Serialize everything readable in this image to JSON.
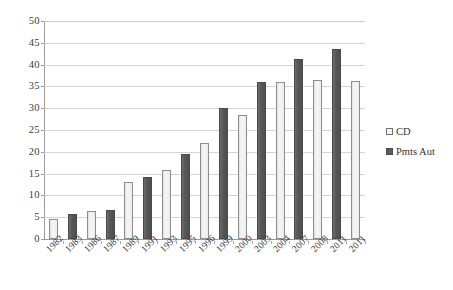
{
  "chart_data": {
    "type": "bar",
    "title": "",
    "subtitle": "",
    "xlabel": "",
    "ylabel": "",
    "ylim": [
      0,
      50
    ],
    "ytick_step": 5,
    "yticks": [
      "50",
      "45",
      "40",
      "35",
      "30",
      "25",
      "20",
      "15",
      "10",
      "5",
      "0"
    ],
    "grid": true,
    "legend_position": "right",
    "categories": [
      "1982",
      "1983",
      "1986",
      "1987",
      "1989",
      "1991",
      "1993",
      "1995",
      "1996",
      "1999",
      "2000",
      "2003",
      "2004",
      "2007",
      "2008",
      "2011",
      "2011"
    ],
    "series": [
      {
        "name": "CD",
        "color": "#eeeeee",
        "border": "#8d8d8d",
        "values": [
          4.6,
          null,
          6.4,
          null,
          13.0,
          null,
          15.8,
          null,
          22.0,
          null,
          28.4,
          null,
          36.0,
          null,
          36.4,
          null,
          36.2
        ]
      },
      {
        "name": "Pmts Aut",
        "color": "#5b5b5b",
        "border": "#4a4a4a",
        "values": [
          null,
          5.7,
          null,
          6.7,
          null,
          14.2,
          null,
          19.4,
          null,
          30.0,
          null,
          36.0,
          null,
          41.4,
          null,
          43.5,
          null
        ]
      }
    ],
    "bars": [
      {
        "category": "1982",
        "series": "CD",
        "value": 4.6
      },
      {
        "category": "1983",
        "series": "Pmts Aut",
        "value": 5.7
      },
      {
        "category": "1986",
        "series": "CD",
        "value": 6.4
      },
      {
        "category": "1987",
        "series": "Pmts Aut",
        "value": 6.7
      },
      {
        "category": "1989",
        "series": "CD",
        "value": 13.0
      },
      {
        "category": "1991",
        "series": "Pmts Aut",
        "value": 14.2
      },
      {
        "category": "1993",
        "series": "CD",
        "value": 15.8
      },
      {
        "category": "1995",
        "series": "Pmts Aut",
        "value": 19.4
      },
      {
        "category": "1996",
        "series": "CD",
        "value": 22.0
      },
      {
        "category": "1999",
        "series": "Pmts Aut",
        "value": 30.0
      },
      {
        "category": "2000",
        "series": "CD",
        "value": 28.4
      },
      {
        "category": "2003",
        "series": "Pmts Aut",
        "value": 36.0
      },
      {
        "category": "2004",
        "series": "CD",
        "value": 36.0
      },
      {
        "category": "2007",
        "series": "Pmts Aut",
        "value": 41.4
      },
      {
        "category": "2008",
        "series": "CD",
        "value": 36.4
      },
      {
        "category": "2011",
        "series": "Pmts Aut",
        "value": 43.5
      },
      {
        "category": "2011",
        "series": "CD",
        "value": 36.2
      }
    ]
  },
  "legend": {
    "items": [
      {
        "label": "CD",
        "swatch": "cd"
      },
      {
        "label": "Pmts Aut",
        "swatch": "pmts"
      }
    ]
  }
}
